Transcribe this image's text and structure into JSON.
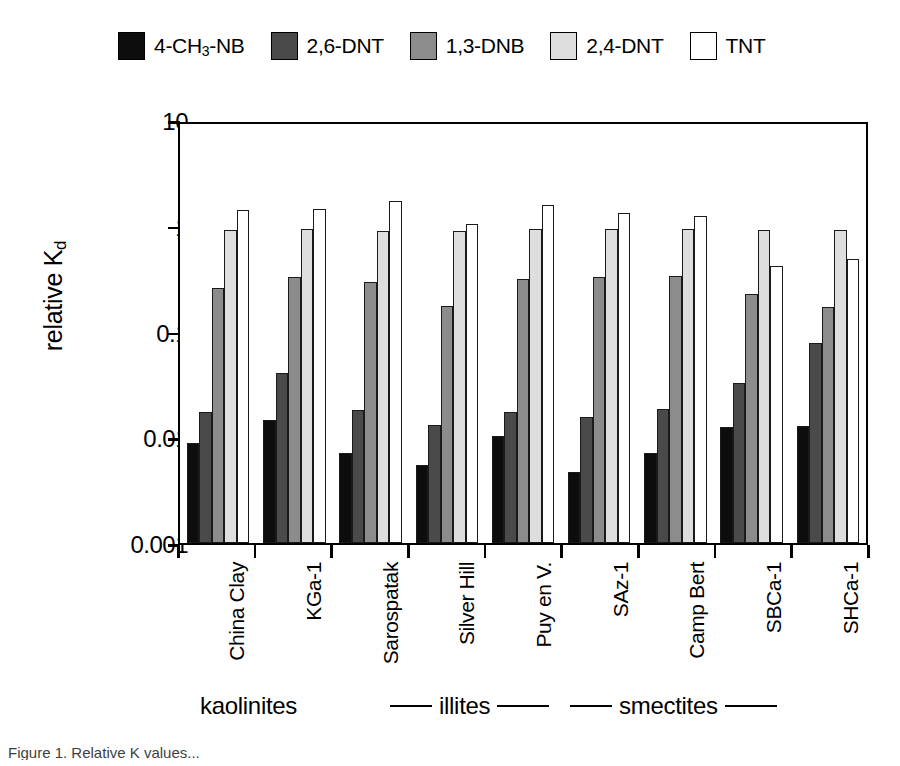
{
  "chart_data": {
    "type": "bar",
    "title": "",
    "xlabel": "",
    "ylabel": "relative K",
    "ylabel_sub": "d",
    "ylim": [
      0.001,
      10
    ],
    "yscale": "log",
    "grid": false,
    "legend_position": "top",
    "ytick_labels": [
      "10",
      "1",
      "0.1",
      "0.01",
      "0.001"
    ],
    "ytick_values": [
      10,
      1,
      0.1,
      0.01,
      0.001
    ],
    "categories": [
      "China Clay",
      "KGa-1",
      "Sarospatak",
      "Silver Hill",
      "Puy en V.",
      "SAz-1",
      "Camp Bert",
      "SBCa-1",
      "SHCa-1"
    ],
    "series": [
      {
        "name": "4-CH3-NB",
        "label_html": "4-CH<sub>3</sub>-NB",
        "color": "#0d0d0d",
        "values": [
          0.009,
          0.015,
          0.0072,
          0.0056,
          0.0105,
          0.0048,
          0.0073,
          0.0128,
          0.0132
        ]
      },
      {
        "name": "2,6-DNT",
        "label_html": "2,6-DNT",
        "color": "#4a4a4a",
        "values": [
          0.018,
          0.042,
          0.0185,
          0.0133,
          0.018,
          0.0159,
          0.019,
          0.034,
          0.082
        ]
      },
      {
        "name": "1,3-DNB",
        "label_html": "1,3-DNB",
        "color": "#8c8c8c",
        "values": [
          0.27,
          0.35,
          0.31,
          0.185,
          0.33,
          0.35,
          0.355,
          0.24,
          0.18
        ]
      },
      {
        "name": "2,4-DNT",
        "label_html": "2,4-DNT",
        "color": "#dedede",
        "values": [
          0.97,
          1.0,
          0.96,
          0.95,
          1.0,
          0.99,
          0.99,
          0.98,
          0.98
        ]
      },
      {
        "name": "TNT",
        "label_html": "TNT",
        "color": "#ffffff",
        "values": [
          1.5,
          1.55,
          1.85,
          1.12,
          1.68,
          1.4,
          1.32,
          0.44,
          0.52
        ]
      }
    ],
    "group_bands": [
      {
        "label": "kaolinites",
        "left_rule": false,
        "right_rule": false
      },
      {
        "label": "illites",
        "left_rule": true,
        "right_rule": true
      },
      {
        "label": "smectites",
        "left_rule": true,
        "right_rule": true
      }
    ]
  },
  "caption": "Figure 1.  Relative K  values..."
}
